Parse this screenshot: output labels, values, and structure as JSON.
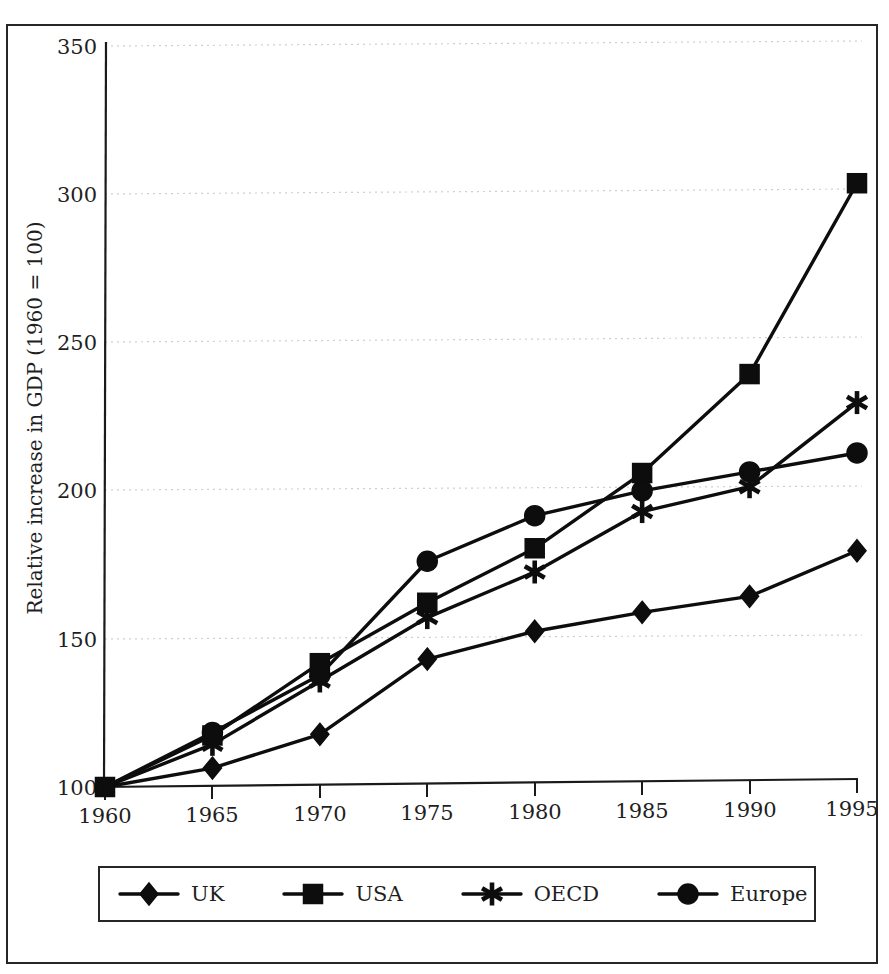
{
  "chart_data": {
    "type": "line",
    "title": "",
    "xlabel": "",
    "ylabel": "Relative increase in GDP (1960 = 100)",
    "x": [
      1960,
      1965,
      1970,
      1975,
      1980,
      1985,
      1990,
      1995
    ],
    "xtick_labels": [
      "1960",
      "1965",
      "1970",
      "1975",
      "1980",
      "1985",
      "1990",
      "1995"
    ],
    "ytick_labels": [
      "100",
      "150",
      "200",
      "250",
      "300",
      "350"
    ],
    "yticks": [
      100,
      150,
      200,
      250,
      300,
      350
    ],
    "xlim": [
      1960,
      1995
    ],
    "ylim": [
      100,
      350
    ],
    "grid": "horizontal-dotted",
    "legend_position": "bottom",
    "series": [
      {
        "name": "UK",
        "marker": "diamond",
        "values": [
          100,
          106,
          117,
          142,
          151,
          157,
          162,
          177
        ]
      },
      {
        "name": "USA",
        "marker": "square",
        "values": [
          100,
          117,
          141,
          161,
          179,
          204,
          237,
          301
        ]
      },
      {
        "name": "OECD",
        "marker": "asterisk",
        "values": [
          100,
          114,
          135,
          156,
          171,
          191,
          199,
          227
        ]
      },
      {
        "name": "Europe",
        "marker": "circle",
        "values": [
          100,
          118,
          137,
          175,
          190,
          198,
          204,
          210
        ]
      }
    ],
    "colors": {
      "line": "#0d0d0d",
      "marker": "#0d0d0d",
      "grid": "#cfcfcf",
      "axis": "#1a1a1a",
      "background": "#ffffff",
      "border": "#262626"
    }
  },
  "legend": {
    "items": [
      {
        "label": "UK",
        "marker": "diamond"
      },
      {
        "label": "USA",
        "marker": "square"
      },
      {
        "label": "OECD",
        "marker": "asterisk"
      },
      {
        "label": "Europe",
        "marker": "circle"
      }
    ]
  },
  "axes": {
    "y_title": "Relative increase in GDP (1960 = 100)",
    "y_labels": [
      "350",
      "300",
      "250",
      "200",
      "150",
      "100"
    ],
    "x_labels": [
      "1960",
      "1965",
      "1970",
      "1975",
      "1980",
      "1985",
      "1990",
      "1995"
    ]
  }
}
